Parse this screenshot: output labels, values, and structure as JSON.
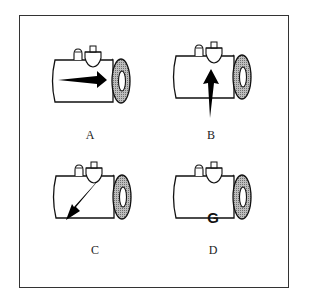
{
  "figure": {
    "panels": [
      {
        "id": "A",
        "label": "A",
        "indicator": "arrow-right",
        "center_text": ""
      },
      {
        "id": "B",
        "label": "B",
        "indicator": "arrow-up",
        "center_text": ""
      },
      {
        "id": "C",
        "label": "C",
        "indicator": "arrow-down-left",
        "center_text": ""
      },
      {
        "id": "D",
        "label": "D",
        "indicator": "letter",
        "center_text": "G"
      }
    ],
    "colors": {
      "stroke": "#111111",
      "hatch": "#9a9a9a",
      "frame": "#333333"
    }
  }
}
